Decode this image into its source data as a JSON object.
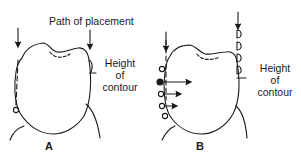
{
  "figure": {
    "panel_a": {
      "label": "A",
      "annotations": {
        "path_label": "Path of placement",
        "contour_label_line1": "Height",
        "contour_label_line2": "of",
        "contour_label_line3": "contour"
      }
    },
    "panel_b": {
      "label": "B",
      "annotations": {
        "contour_label_line1": "Height",
        "contour_label_line2": "of",
        "contour_label_line3": "contour"
      }
    },
    "colors": {
      "line": "#1a1a1a",
      "background": "#ffffff"
    }
  }
}
